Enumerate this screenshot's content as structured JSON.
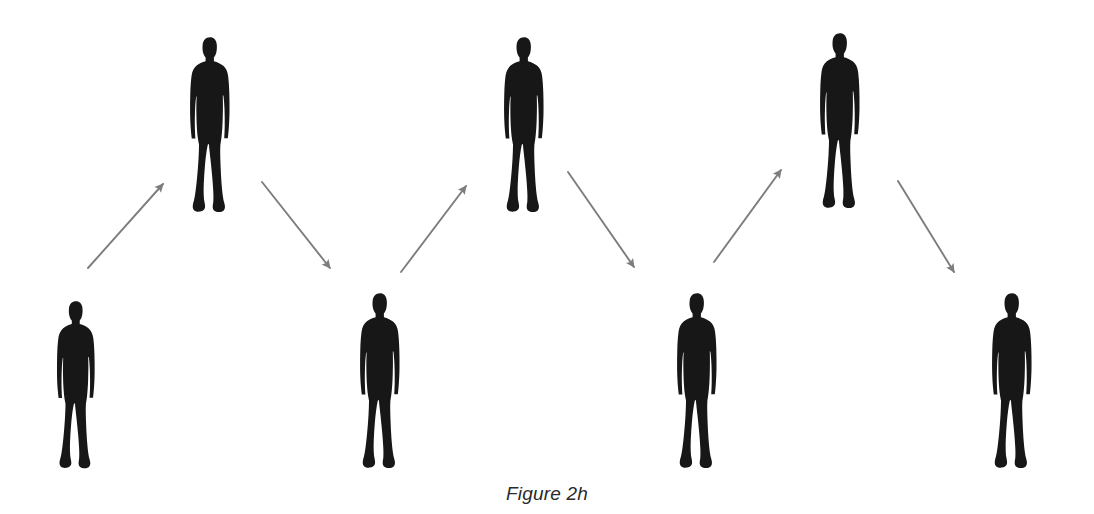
{
  "figure": {
    "caption": "Figure 2h",
    "background_color": "#ffffff",
    "figure_color": "#171717",
    "arrow_color": "#7d7d7d",
    "caption_color": "#2b2b2b",
    "person_count": 7,
    "arrow_count": 6,
    "people": [
      {
        "id": "person-1",
        "row": "lower",
        "order": 1,
        "x": 53,
        "y": 300,
        "width": 46,
        "height": 172
      },
      {
        "id": "person-2",
        "row": "upper",
        "order": 2,
        "x": 186,
        "y": 36,
        "width": 48,
        "height": 180
      },
      {
        "id": "person-3",
        "row": "lower",
        "order": 3,
        "x": 357,
        "y": 292,
        "width": 46,
        "height": 180
      },
      {
        "id": "person-4",
        "row": "upper",
        "order": 4,
        "x": 500,
        "y": 36,
        "width": 48,
        "height": 180
      },
      {
        "id": "person-5",
        "row": "lower",
        "order": 5,
        "x": 674,
        "y": 292,
        "width": 46,
        "height": 180
      },
      {
        "id": "person-6",
        "row": "upper",
        "order": 6,
        "x": 816,
        "y": 32,
        "width": 48,
        "height": 180
      },
      {
        "id": "person-7",
        "row": "lower",
        "order": 7,
        "x": 989,
        "y": 292,
        "width": 46,
        "height": 180
      }
    ],
    "arrows": [
      {
        "id": "arrow-1",
        "direction": "up-right",
        "from": "person-1",
        "to": "person-2",
        "x1": 88,
        "y1": 268,
        "x2": 163,
        "y2": 184
      },
      {
        "id": "arrow-2",
        "direction": "down-right",
        "from": "person-2",
        "to": "person-3",
        "x1": 262,
        "y1": 182,
        "x2": 330,
        "y2": 268
      },
      {
        "id": "arrow-3",
        "direction": "up-right",
        "from": "person-3",
        "to": "person-4",
        "x1": 401,
        "y1": 272,
        "x2": 466,
        "y2": 186
      },
      {
        "id": "arrow-4",
        "direction": "down-right",
        "from": "person-4",
        "to": "person-5",
        "x1": 568,
        "y1": 172,
        "x2": 634,
        "y2": 267
      },
      {
        "id": "arrow-5",
        "direction": "up-right",
        "from": "person-5",
        "to": "person-6",
        "x1": 714,
        "y1": 262,
        "x2": 781,
        "y2": 170
      },
      {
        "id": "arrow-6",
        "direction": "down-right",
        "from": "person-6",
        "to": "person-7",
        "x1": 898,
        "y1": 181,
        "x2": 954,
        "y2": 272
      }
    ]
  }
}
